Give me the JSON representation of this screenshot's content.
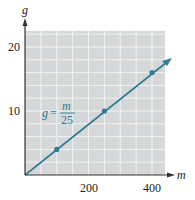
{
  "chart_data": {
    "type": "line",
    "title": "",
    "xlabel": "m",
    "ylabel": "g",
    "xlim": [
      0,
      440
    ],
    "ylim": [
      0,
      22.5
    ],
    "x_ticks": [
      200,
      400
    ],
    "y_ticks": [
      10,
      20
    ],
    "x_tick_labels": [
      "200",
      "400"
    ],
    "y_tick_labels": [
      "10",
      "20"
    ],
    "grid": true,
    "series": [
      {
        "name": "g = m/25",
        "x": [
          0,
          440
        ],
        "y": [
          0,
          17.6
        ],
        "points": [
          {
            "x": 100,
            "y": 4
          },
          {
            "x": 250,
            "y": 10
          },
          {
            "x": 400,
            "y": 16
          }
        ]
      }
    ],
    "annotations": [
      {
        "text": "g = m/25",
        "lhs": "g",
        "numerator": "m",
        "denominator": "25",
        "x": 80,
        "y": 9
      }
    ],
    "colors": {
      "line": "#2d7d93",
      "grid_bg": "#d5d7d9",
      "grid_line": "#f2f3f3",
      "axis": "#333333"
    }
  }
}
